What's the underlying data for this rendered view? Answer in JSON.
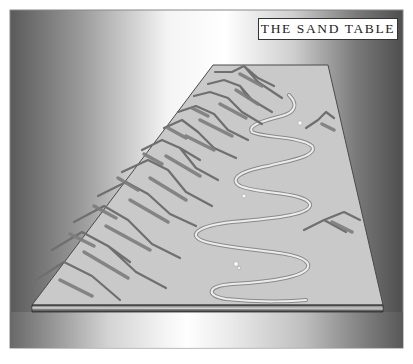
{
  "title": "THE SAND TABLE",
  "illustration": {
    "subject": "sand-table",
    "table": {
      "top_left": [
        213,
        65
      ],
      "top_right": [
        328,
        65
      ],
      "bottom_right": [
        383,
        305
      ],
      "bottom_left": [
        32,
        305
      ],
      "edge_thickness": 7
    },
    "colors": {
      "table_surface": "#c9c9c9",
      "mountain_line": "#6f6f6f",
      "mountain_shadow": "#7d7d7d",
      "river": "#ececec",
      "river_outline": "#8a8a8a",
      "frame_dark": "#555555",
      "frame_light": "#ffffff"
    }
  }
}
